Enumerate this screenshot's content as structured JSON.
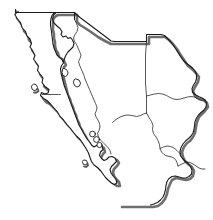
{
  "figure": {
    "name": "northwest-mexico-outline-map",
    "title": "Northwest Mexico",
    "width": 213,
    "height": 220,
    "background_color": "#ffffff",
    "line_color": "#1a1a1a",
    "shadow_color": "#555555",
    "fill_color": "#ffffff",
    "outer_stroke_width": 1.1,
    "internal_stroke_width": 0.8,
    "shadow_stroke_width": 2.6,
    "shadow_offset_x": 2,
    "shadow_offset_y": 2,
    "style": "line-art outline, drop shadow on coastline, no labels"
  },
  "map": {
    "type": "political-outline",
    "projection_note": "unlabeled outline silhouette",
    "regions": [
      {
        "id": "baja-california",
        "label": "Baja California",
        "label_visible": false
      },
      {
        "id": "baja-california-sur",
        "label": "Baja California Sur",
        "label_visible": false
      },
      {
        "id": "sonora",
        "label": "Sonora",
        "label_visible": false
      },
      {
        "id": "chihuahua",
        "label": "Chihuahua",
        "label_visible": false
      },
      {
        "id": "sinaloa",
        "label": "Sinaloa",
        "label_visible": false
      }
    ],
    "islands": [
      {
        "id": "isla-cedros",
        "label_visible": false
      },
      {
        "id": "isla-angel-de-la-guarda",
        "label_visible": false
      },
      {
        "id": "isla-tiburon",
        "label_visible": false
      },
      {
        "id": "gulf-islet-1",
        "label_visible": false
      },
      {
        "id": "gulf-islet-2",
        "label_visible": false
      },
      {
        "id": "gulf-islet-3",
        "label_visible": false
      },
      {
        "id": "isla-espiritu-santo",
        "label_visible": false
      }
    ],
    "labels": [],
    "legend": {
      "visible": false,
      "entries": []
    },
    "scale_bar": {
      "visible": false
    },
    "north_arrow": {
      "visible": false
    }
  },
  "geometry": {
    "mainland_outline": "M 15.5 9.5 L 16.5 12.8 L 14.8 14.5 L 17.2 18.5 L 20.5 22.5 L 22.0 27.5 L 25.5 31.5 L 27.0 36.0 L 30.0 39.0 L 31.5 43.5 L 30.0 47.0 L 32.5 50.5 L 35.0 55.5 L 33.5 59.0 L 36.0 62.5 L 38.5 66.0 L 37.5 70.5 L 40.0 74.0 L 43.0 78.0 L 42.0 82.5 L 45.0 86.5 L 49.0 89.5 L 48.0 93.0 L 44.5 94.0 L 41.5 92.5 L 40.5 95.5 L 43.5 98.5 L 47.0 100.5 L 50.5 104.0 L 54.0 108.0 L 57.5 112.0 L 60.0 116.5 L 63.5 120.0 L 67.0 124.5 L 70.5 128.5 L 73.5 132.5 L 77.0 136.5 L 80.5 140.0 L 83.5 144.5 L 86.0 148.5 L 88.5 153.0 L 90.0 157.5 L 91.5 161.5 L 94.0 165.0 L 97.5 167.5 L 100.5 170.5 L 103.0 174.0 L 105.5 177.5 L 108.5 180.5 L 111.5 183.0 L 114.5 184.5 L 117.0 183.0 L 116.0 179.5 L 113.5 176.5 L 111.0 173.0 L 110.0 169.5 L 111.5 166.5 L 114.0 164.0 L 116.5 161.5 L 115.0 158.0 L 112.0 156.5 L 109.0 157.0 L 106.5 159.5 L 104.0 160.5 L 101.5 158.5 L 99.5 155.5 L 100.5 152.0 L 103.0 149.5 L 102.0 146.0 L 99.0 144.0 L 96.5 145.5 L 94.0 147.0 L 91.5 145.0 L 89.5 142.0 L 87.0 139.0 L 85.0 135.5 L 83.0 132.0 L 81.0 128.5 L 79.0 125.0 L 77.5 121.0 L 76.0 117.0 L 74.5 113.0 L 73.0 109.0 L 71.5 105.0 L 70.0 101.0 L 68.5 97.0 L 67.0 93.0 L 65.5 89.0 L 64.0 85.0 L 63.0 81.0 L 62.0 77.0 L 61.0 73.0 L 60.5 69.0 L 61.5 65.5 L 63.5 63.0 L 62.0 59.5 L 59.5 57.5 L 57.0 55.0 L 55.5 51.5 L 54.0 48.0 L 53.0 44.0 L 52.5 40.0 L 52.0 36.0 L 51.5 32.0 L 51.0 28.5 L 50.5 25.0 L 50.5 21.5 L 51.0 18.5 L 52.0 15.5 L 53.5 13.5 L 56.0 12.5 L 58.5 12.5 L 61.5 12.5 L 64.5 12.5 L 67.0 12.5 L 70.0 12.5 L 72.5 12.5 L 74.5 12.5 L 74.5 16.0 L 74.5 19.5 L 76.5 22.0 L 80.0 24.5 L 84.0 27.0 L 88.0 29.5 L 92.0 32.0 L 96.0 34.5 L 100.0 37.0 L 104.0 39.5 L 108.0 41.5 L 112.0 42.0 L 116.0 42.0 L 120.0 42.0 L 124.0 42.0 L 128.0 42.0 L 132.0 42.0 L 136.0 42.0 L 140.0 42.0 L 144.0 42.0 L 146.5 42.0 L 146.5 38.5 L 146.5 35.0 L 150.0 35.0 L 153.5 35.0 L 157.0 35.0 L 160.5 35.0 L 164.0 36.0 L 167.0 38.0 L 170.0 40.5 L 172.5 43.5 L 175.0 46.5 L 177.0 50.0 L 179.0 53.5 L 181.0 57.0 L 183.0 60.5 L 185.5 63.5 L 188.5 66.0 L 191.5 68.0 L 194.0 70.5 L 196.0 73.5 L 196.5 77.0 L 196.0 80.5 L 194.5 83.5 L 192.5 86.0 L 191.0 89.0 L 191.5 92.5 L 193.5 95.0 L 196.5 96.5 L 199.5 97.5 L 202.5 98.5 L 205.0 100.0 L 206.5 103.0 L 206.0 106.5 L 204.0 109.0 L 201.5 111.0 L 199.0 113.0 L 197.0 115.5 L 195.5 118.5 L 194.5 122.0 L 194.0 125.5 L 193.5 129.0 L 192.5 132.5 L 191.0 135.5 L 189.0 138.0 L 186.5 140.0 L 184.0 142.0 L 182.0 144.5 L 180.5 147.5 L 180.0 151.0 L 180.5 154.5 L 182.0 157.5 L 184.0 160.0 L 186.5 162.0 L 189.0 164.0 L 191.0 166.5 L 192.0 170.0 L 191.5 173.5 L 189.5 176.0 L 187.0 177.5 L 184.0 178.0 L 181.0 177.5 L 178.0 176.5 L 175.0 176.0 L 172.0 176.5 L 169.5 178.0 L 167.5 180.5 L 166.5 184.0 L 166.0 187.5 L 165.5 191.0 L 164.5 194.5 L 163.0 197.5 L 161.0 200.0 L 158.5 202.0 L 156.0 203.5 L 153.0 204.5 L 150.0 205.0 L 147.0 205.0 L 144.0 205.0 L 141.0 205.0 L 138.0 205.0 L 135.0 205.0 L 132.0 205.0 L 129.0 205.0 L 126.0 205.0 L 123.0 205.0 L 120.5 205.0 L 118.0 203.0 L 115.5 200.0 L 113.0 197.0 L 110.5 194.0 L 108.0 191.0 L 105.5 188.0 L 103.0 185.0 L 100.5 182.0 L 98.0 179.0 L 95.5 176.0 L 93.0 173.0 L 90.5 170.0 L 88.0 167.0 L 85.5 164.0 L 83.0 161.0 L 80.5 158.0 L 78.0 155.0 L 75.5 152.0 L 73.0 149.0 L 70.5 146.0 L 68.0 143.0 L 65.5 140.0 L 63.0 137.0 L 60.5 134.0 L 58.0 131.0 L 55.5 128.0 L 53.0 125.0 L 50.5 122.0 L 48.0 119.0 L 45.5 116.0 L 43.0 113.0 L 40.5 110.0 L 38.0 107.0 L 35.5 104.0 L 33.0 101.0 L 30.5 98.0 L 28.0 95.0 L 25.5 92.0 L 23.0 89.0 L 20.5 86.0 L 19.0 82.5 L 18.0 79.0 L 17.0 75.5 L 16.0 72.0 L 15.5 68.5 L 15.0 65.0 L 14.5 61.5 L 14.0 58.0 L 13.5 54.5 L 13.0 51.0 L 12.5 47.5 L 12.5 44.0 L 13.0 40.5 L 13.5 37.0 L 14.0 33.5 L 14.5 30.0 L 15.0 26.5 L 15.0 23.0 L 15.0 19.5 L 15.0 16.0 L 15.5 12.5 Z",
    "note": "Path data approximates the traced silhouette; exact coordinates are layout, not content."
  },
  "annotations": {
    "visible_text": [],
    "text_count": 0
  }
}
